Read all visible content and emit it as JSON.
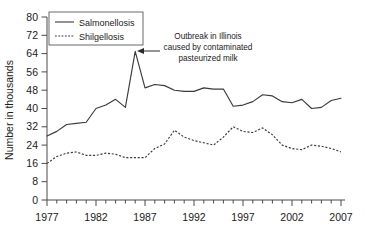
{
  "chart_data": {
    "type": "line",
    "title": "",
    "xlabel": "",
    "ylabel": "Number in thousands",
    "xlim": [
      1977,
      2007
    ],
    "ylim": [
      0,
      80
    ],
    "grid": false,
    "legend_position": "top-left",
    "x": [
      1977,
      1978,
      1979,
      1980,
      1981,
      1982,
      1983,
      1984,
      1985,
      1986,
      1987,
      1988,
      1989,
      1990,
      1991,
      1992,
      1993,
      1994,
      1995,
      1996,
      1997,
      1998,
      1999,
      2000,
      2001,
      2002,
      2003,
      2004,
      2005,
      2006,
      2007
    ],
    "xticks": [
      1977,
      1982,
      1987,
      1992,
      1997,
      2002,
      2007
    ],
    "xtick_labels": [
      "1977",
      "1982",
      "1987",
      "1992",
      "1997",
      "2002",
      "2007"
    ],
    "yticks": [
      0,
      8,
      16,
      24,
      32,
      40,
      48,
      56,
      64,
      72,
      80
    ],
    "ytick_labels": [
      "0",
      "8",
      "16",
      "24",
      "32",
      "40",
      "48",
      "56",
      "64",
      "72",
      "80"
    ],
    "series": [
      {
        "name": "Salmonellosis",
        "style": "solid",
        "values": [
          28.0,
          30.0,
          33.0,
          33.5,
          34.0,
          40.0,
          41.5,
          44.0,
          40.5,
          65.0,
          49.0,
          50.5,
          50.0,
          48.0,
          47.5,
          47.5,
          49.0,
          48.5,
          48.5,
          41.0,
          41.5,
          43.0,
          46.0,
          45.5,
          43.0,
          42.5,
          44.0,
          40.0,
          40.5,
          43.5,
          44.5
        ]
      },
      {
        "name": "Shilgellosis",
        "style": "dotted",
        "values": [
          16.0,
          19.0,
          20.5,
          21.0,
          19.5,
          19.5,
          20.5,
          20.0,
          18.5,
          18.5,
          18.5,
          22.5,
          24.5,
          30.5,
          27.5,
          26.0,
          25.0,
          24.0,
          27.5,
          32.0,
          30.0,
          29.5,
          31.5,
          28.5,
          24.0,
          22.5,
          22.0,
          24.0,
          23.5,
          22.5,
          21.0
        ]
      }
    ],
    "annotations": [
      {
        "name": "outbreak-annotation",
        "lines": [
          "Outbreak in Illinois",
          "caused by contaminated",
          "pasteurized milk"
        ],
        "points_to_year": 1985,
        "points_to_value": 65
      }
    ]
  },
  "legend": {
    "entries": [
      {
        "label": "Salmonellosis",
        "style": "solid"
      },
      {
        "label": "Shilgellosis",
        "style": "dotted"
      }
    ]
  },
  "colors": {
    "line": "#3a3a3a",
    "axis": "#4a4a4a",
    "text": "#1a1a1a",
    "background": "#ffffff"
  }
}
